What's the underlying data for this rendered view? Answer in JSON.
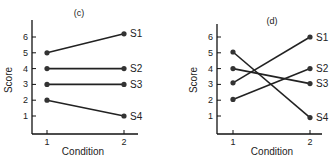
{
  "chart_data": [
    {
      "type": "line",
      "title": "(c)",
      "xlabel": "Condition",
      "ylabel": "Score",
      "x": [
        1,
        2
      ],
      "x_ticks": [
        "1",
        "2"
      ],
      "y_ticks": [
        "1",
        "2",
        "3",
        "4",
        "5",
        "6"
      ],
      "ylim": [
        0,
        7
      ],
      "grid": false,
      "series": [
        {
          "name": "S1",
          "values": [
            5,
            6.2
          ]
        },
        {
          "name": "S2",
          "values": [
            4,
            4
          ]
        },
        {
          "name": "S3",
          "values": [
            3,
            3
          ]
        },
        {
          "name": "S4",
          "values": [
            2,
            1
          ]
        }
      ]
    },
    {
      "type": "line",
      "title": "(d)",
      "xlabel": "Condition",
      "ylabel": "Score",
      "x": [
        1,
        2
      ],
      "x_ticks": [
        "1",
        "2"
      ],
      "y_ticks": [
        "1",
        "2",
        "3",
        "4",
        "5",
        "6"
      ],
      "ylim": [
        0,
        7
      ],
      "grid": false,
      "series": [
        {
          "name": "S1",
          "values": [
            3.1,
            6
          ]
        },
        {
          "name": "S2",
          "values": [
            2.05,
            4
          ]
        },
        {
          "name": "S3",
          "values": [
            4,
            3.05
          ]
        },
        {
          "name": "S4",
          "values": [
            5.05,
            0.9
          ]
        }
      ]
    }
  ],
  "colors": {
    "line": "#222222",
    "marker": "#333333",
    "axis": "#111111"
  }
}
